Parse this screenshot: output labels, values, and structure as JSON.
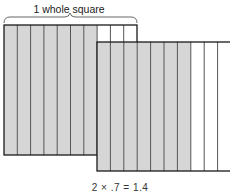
{
  "diagram": {
    "label": "1 whole square",
    "equation": "2 × .7 = 1.4",
    "squares": [
      {
        "name": "square-1",
        "columns": 10,
        "shaded_columns": 7
      },
      {
        "name": "square-2",
        "columns": 10,
        "shaded_columns": 7
      }
    ],
    "colors": {
      "shaded": "#d6d6d6",
      "unshaded": "#ffffff",
      "line": "#555555",
      "border": "#1a1a1a"
    }
  }
}
